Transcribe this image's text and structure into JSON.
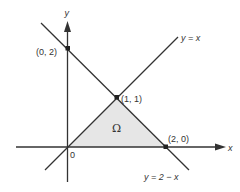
{
  "diagram": {
    "type": "coordinate-region",
    "axes": {
      "x_label": "x",
      "y_label": "y",
      "origin_label": "0"
    },
    "lines": [
      {
        "id": "line-y-equals-x",
        "label": "y = x",
        "equation": "y = x"
      },
      {
        "id": "line-y-equals-2-minus-x",
        "label": "y = 2 − x",
        "equation": "y = 2 - x"
      }
    ],
    "points": [
      {
        "id": "point-0-2",
        "label": "(0, 2)",
        "x": 0,
        "y": 2
      },
      {
        "id": "point-1-1",
        "label": "(1, 1)",
        "x": 1,
        "y": 1
      },
      {
        "id": "point-2-0",
        "label": "(2, 0)",
        "x": 2,
        "y": 0
      }
    ],
    "region": {
      "label": "Ω",
      "vertices": [
        [
          0,
          0
        ],
        [
          1,
          1
        ],
        [
          2,
          0
        ]
      ],
      "fill": "#e6e6e6"
    },
    "colors": {
      "line": "#333333",
      "region_fill": "#e6e6e6",
      "background": "#ffffff"
    }
  }
}
